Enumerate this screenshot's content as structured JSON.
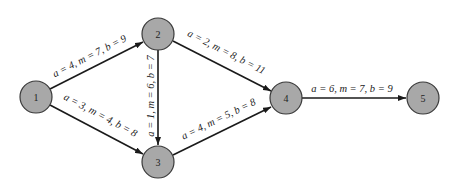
{
  "diagram": {
    "type": "PERT activity network",
    "nodes": [
      {
        "id": "1",
        "label": "1",
        "x": 36,
        "y": 97
      },
      {
        "id": "2",
        "label": "2",
        "x": 158,
        "y": 34
      },
      {
        "id": "3",
        "label": "3",
        "x": 158,
        "y": 162
      },
      {
        "id": "4",
        "label": "4",
        "x": 286,
        "y": 99
      },
      {
        "id": "5",
        "label": "5",
        "x": 423,
        "y": 99
      }
    ],
    "edges": [
      {
        "from": "1",
        "to": "2",
        "label": "a = 4, m = 7, b = 9"
      },
      {
        "from": "1",
        "to": "3",
        "label": "a = 3, m = 4, b = 8"
      },
      {
        "from": "2",
        "to": "3",
        "label": "a = 1, m = 6, b = 7"
      },
      {
        "from": "2",
        "to": "4",
        "label": "a = 2, m = 8, b = 11"
      },
      {
        "from": "3",
        "to": "4",
        "label": "a = 4, m = 5, b = 8"
      },
      {
        "from": "4",
        "to": "5",
        "label": "a = 6, m = 7, b = 9"
      }
    ]
  }
}
